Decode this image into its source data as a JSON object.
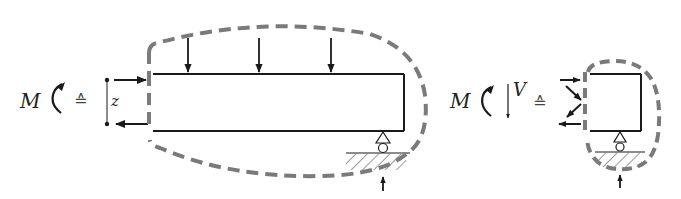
{
  "figure": {
    "type": "free-body-diagram"
  },
  "colors": {
    "line": "#1a1a1a",
    "outline_dash": "#7a7a7a",
    "hatch": "#555555"
  },
  "left_part": {
    "moment_label": "M",
    "moment_icon": "counterclockwise-moment-arrow",
    "equivalence_symbol": "≙",
    "lever_arm_label": "z",
    "beam_loads": 3
  },
  "right_part": {
    "moment_label": "M",
    "moment_icon": "counterclockwise-moment-arrow",
    "shear_label": "V",
    "shear_icon": "down-arrow",
    "equivalence_symbol": "≙"
  }
}
